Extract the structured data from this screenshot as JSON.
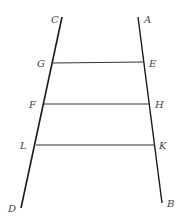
{
  "diagram": {
    "stroke_color": "#1a1a1a",
    "rung_color": "#333333",
    "label_color": "#444444",
    "lines": {
      "left": {
        "start_label": "C",
        "end_label": "D"
      },
      "right": {
        "start_label": "A",
        "end_label": "B"
      }
    },
    "rungs": [
      {
        "left_label": "G",
        "right_label": "E"
      },
      {
        "left_label": "F",
        "right_label": "H"
      },
      {
        "left_label": "L",
        "right_label": "K"
      }
    ]
  }
}
